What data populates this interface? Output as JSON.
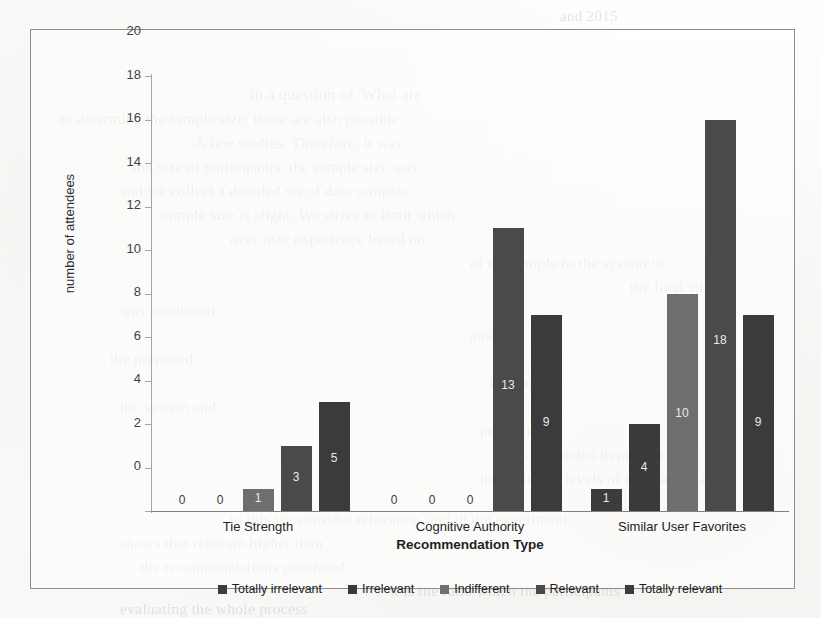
{
  "figure": {
    "frame_border_color": "#8c8c8c",
    "background_color": "#fdfdfc"
  },
  "chart_data": {
    "type": "bar",
    "title": "",
    "subtitle": "",
    "xlabel": "Recommendation Type",
    "ylabel": "number of attendees",
    "categories": [
      "Tie Strength",
      "Cognitive Authority",
      "Similar User Favorites"
    ],
    "series": [
      {
        "name": "Totally irrelevant",
        "color": "#3c3c3c",
        "values": [
          0,
          0,
          1
        ]
      },
      {
        "name": "Irrelevant",
        "color": "#3a3a3a",
        "values": [
          0,
          0,
          4
        ]
      },
      {
        "name": "Indifferent",
        "color": "#6e6e6e",
        "values": [
          1,
          0,
          10
        ]
      },
      {
        "name": "Relevant",
        "color": "#4a4a4a",
        "values": [
          3,
          13,
          18
        ]
      },
      {
        "name": "Totally relevant",
        "color": "#3b3b3b",
        "values": [
          5,
          9,
          9
        ]
      }
    ],
    "ylim": [
      0,
      20
    ],
    "yticks": [
      0,
      2,
      4,
      6,
      8,
      10,
      12,
      14,
      16,
      18,
      20
    ],
    "ytick_labels": [
      "0",
      "2",
      "4",
      "6",
      "8",
      "10",
      "12",
      "14",
      "16",
      "18",
      "20"
    ],
    "grid": false,
    "legend_position": "bottom",
    "data_labels": true,
    "data_label_matrix": [
      [
        "0",
        "0",
        "1",
        "3",
        "5"
      ],
      [
        "0",
        "0",
        "0",
        "13",
        "9"
      ],
      [
        "1",
        "4",
        "10",
        "18",
        "9"
      ]
    ]
  },
  "bleed_through_lines": [
    {
      "text": "and 2015",
      "x": 560,
      "y": 8,
      "size": 15
    },
    {
      "text": "in a question of 'What are",
      "x": 250,
      "y": 86,
      "size": 16
    },
    {
      "text": "to determine the sample size; these are also possible",
      "x": 60,
      "y": 110,
      "size": 15.5
    },
    {
      "text": "A few studies. Therefore, it was",
      "x": 195,
      "y": 134,
      "size": 15.5
    },
    {
      "text": "and size of participants, the sample size was",
      "x": 130,
      "y": 158,
      "size": 15.5
    },
    {
      "text": "and we collect a detailed set of data samples",
      "x": 120,
      "y": 182,
      "size": 15.5
    },
    {
      "text": "sample size is slight. We strive to limit which",
      "x": 160,
      "y": 206,
      "size": 15.5
    },
    {
      "text": "over user experience based on",
      "x": 230,
      "y": 230,
      "size": 15.5
    },
    {
      "text": "of the sample to the system to",
      "x": 470,
      "y": 254,
      "size": 15.5
    },
    {
      "text": "the final study",
      "x": 630,
      "y": 278,
      "size": 15.5
    },
    {
      "text": "was conducted",
      "x": 120,
      "y": 302,
      "size": 15.5
    },
    {
      "text": "analysis",
      "x": 470,
      "y": 326,
      "size": 15.5
    },
    {
      "text": "the proposed",
      "x": 110,
      "y": 350,
      "size": 15.5
    },
    {
      "text": "been more",
      "x": 490,
      "y": 374,
      "size": 15.5
    },
    {
      "text": "the system and",
      "x": 120,
      "y": 398,
      "size": 15.5
    },
    {
      "text": "presented for",
      "x": 480,
      "y": 422,
      "size": 15.5
    },
    {
      "text": "recommended items that",
      "x": 505,
      "y": 446,
      "size": 15.5
    },
    {
      "text": "the resulting levels of the participants.",
      "x": 480,
      "y": 470,
      "size": 15.5
    },
    {
      "text": "to this we consider relevance, and in the experiment",
      "x": 230,
      "y": 510,
      "size": 15.5
    },
    {
      "text": "shows that relevant higher than",
      "x": 120,
      "y": 534,
      "size": 15.5
    },
    {
      "text": "the recommendations generated",
      "x": 140,
      "y": 558,
      "size": 15.5
    },
    {
      "text": "it is the ratio which the participants",
      "x": 390,
      "y": 582,
      "size": 15.5
    },
    {
      "text": "evaluating the whole process",
      "x": 120,
      "y": 600,
      "size": 15.5
    }
  ]
}
